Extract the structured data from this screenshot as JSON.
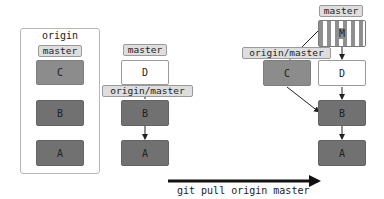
{
  "origin_panel": {
    "title": "origin",
    "branch_label": "master",
    "commits": [
      "C",
      "B",
      "A"
    ]
  },
  "before_panel": {
    "branch_label": "master",
    "remote_label": "origin/master",
    "commits": [
      "D",
      "B",
      "A"
    ]
  },
  "after_panel": {
    "branch_label": "master",
    "remote_label": "origin/master",
    "merge_commit": "M",
    "commits": {
      "c": "C",
      "d": "D",
      "b": "B",
      "a": "A"
    }
  },
  "command": {
    "text": "git pull origin master"
  },
  "colors": {
    "commit_light": "#8c8c8c",
    "commit_dark": "#717171",
    "commit_new": "#ffffff",
    "label_bg": "#dedede",
    "arrow": "#222222"
  }
}
